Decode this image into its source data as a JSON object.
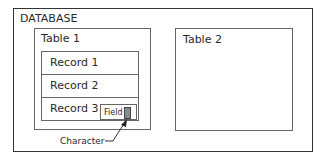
{
  "diagram": {
    "database_label": "DATABASE",
    "tables": [
      {
        "label": "Table 1",
        "records": [
          "Record 1",
          "Record 2",
          "Record 3"
        ]
      },
      {
        "label": "Table 2",
        "records": []
      }
    ],
    "field_label": "Field",
    "character_label": "Character"
  }
}
